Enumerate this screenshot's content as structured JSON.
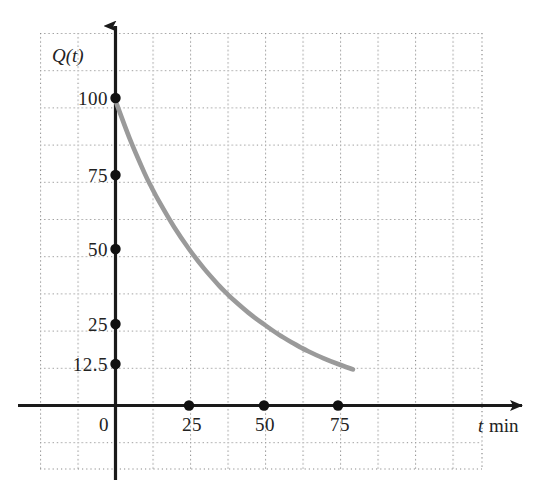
{
  "chart_data": {
    "type": "line",
    "title": "",
    "subtitle": "",
    "xlabel": "t min",
    "ylabel": "Q(t)",
    "x_axis_symbol": "t",
    "x_axis_unit": "min",
    "y_axis_symbol": "Q(t)",
    "xlim": [
      -2,
      10
    ],
    "ylim": [
      -1.2,
      2.6
    ],
    "x_ticks": [
      0,
      25,
      50,
      75
    ],
    "x_tick_labels": [
      "0",
      "25",
      "50",
      "75"
    ],
    "y_ticks": [
      12.5,
      25,
      50,
      75,
      100
    ],
    "y_tick_labels": [
      "12.5",
      "25",
      "50",
      "75",
      "100"
    ],
    "grid": true,
    "grid_style": "dotted",
    "legend": "none",
    "series": [
      {
        "name": "Q(t)",
        "description": "exponential decay, half-life 25 min",
        "color": "#9a9a9a",
        "initial_value": 100,
        "half_life": 25,
        "x": [
          0,
          5,
          10,
          12.5,
          15,
          20,
          25,
          30,
          35,
          37.5,
          40,
          45,
          50,
          55,
          60,
          62.5,
          65,
          70,
          75,
          80,
          85,
          87.5
        ],
        "y": [
          100,
          87.06,
          75.79,
          70.71,
          65.98,
          57.43,
          50,
          43.53,
          37.89,
          35.36,
          32.99,
          28.72,
          25,
          21.76,
          18.95,
          17.68,
          16.49,
          14.36,
          12.5,
          10.88,
          9.47,
          8.84
        ]
      }
    ],
    "marked_points_y_axis": [
      {
        "label": "100",
        "value": 100
      },
      {
        "label": "75",
        "value": 75
      },
      {
        "label": "50",
        "value": 50
      },
      {
        "label": "25",
        "value": 25
      },
      {
        "label": "12.5",
        "value": 12.5
      }
    ],
    "marked_points_x_axis": [
      {
        "label": "25",
        "value": 25
      },
      {
        "label": "50",
        "value": 50
      },
      {
        "label": "75",
        "value": 75
      }
    ]
  },
  "colors": {
    "curve": "#9a9a9a",
    "axis": "#1a1a1a",
    "grid": "#7a7a7a",
    "text": "#222222",
    "background": "#ffffff"
  }
}
